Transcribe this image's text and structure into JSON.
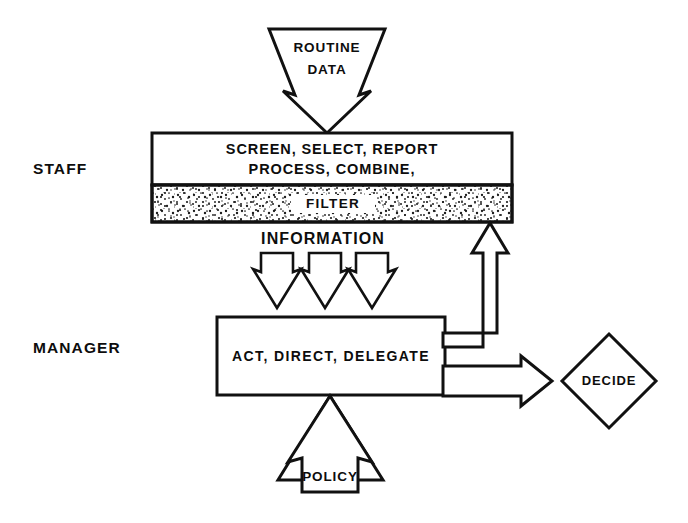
{
  "diagram": {
    "type": "flow-diagram",
    "background_color": "#ffffff",
    "line_color": "#111111",
    "text_color": "#0d0d0d"
  },
  "side_labels": [
    {
      "id": "staff",
      "text": "STAFF"
    },
    {
      "id": "manager",
      "text": "MANAGER"
    }
  ],
  "inputs": {
    "routine_data": {
      "line1": "ROUTINE",
      "line2": "DATA",
      "direction": "down"
    },
    "policy": {
      "line1": "POLICY",
      "direction": "up"
    }
  },
  "staff_box": {
    "line1": "SCREEN, SELECT, REPORT",
    "line2": "PROCESS, COMBINE,",
    "filter_label": "FILTER",
    "filter_fill": "stipple"
  },
  "information_flow": {
    "label": "INFORMATION",
    "arrow_count": 3,
    "direction": "down"
  },
  "manager_box": {
    "line1": "ACT, DIRECT, DELEGATE"
  },
  "decision": {
    "label": "DECIDE",
    "shape": "diamond"
  },
  "connectors": {
    "feedback_to_filter": {
      "direction": "up",
      "from": "manager_box",
      "to": "filter"
    },
    "to_decide": {
      "direction": "right",
      "from": "manager_box",
      "to": "decision"
    }
  }
}
